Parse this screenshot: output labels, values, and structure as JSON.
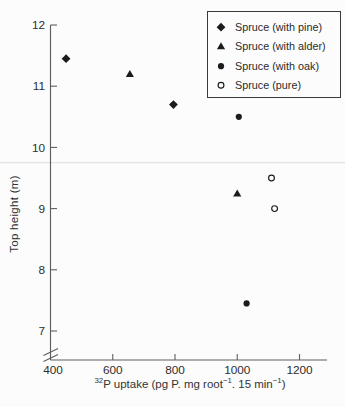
{
  "figure": {
    "background_color": "#fcfcfc",
    "ink_color": "#1c1c1c",
    "axis_color": "#5f5f5f",
    "artifact_line_color": "#dcdcdc"
  },
  "chart_data": {
    "type": "scatter",
    "title": "",
    "ylabel": "Top height (m)",
    "xlabel": "³²P uptake (pg P. mg root⁻¹. 15 min⁻¹)",
    "xlabel_segments": [
      {
        "text": "32",
        "sup": true
      },
      {
        "text": "P uptake (pg P. mg root",
        "sup": false
      },
      {
        "text": "−1",
        "sup": true
      },
      {
        "text": ". 15 min",
        "sup": false
      },
      {
        "text": "−1",
        "sup": true
      },
      {
        "text": ")",
        "sup": false
      }
    ],
    "x_ticks": [
      400,
      600,
      800,
      1000,
      1200
    ],
    "y_ticks": [
      7,
      8,
      9,
      10,
      11,
      12
    ],
    "xlim": [
      400,
      1290
    ],
    "ylim": [
      7,
      12
    ],
    "grid": false,
    "y_axis_break_below": 7,
    "legend_position": "top-right",
    "series": [
      {
        "name": "Spruce (with pine)",
        "marker": "filled-diamond",
        "points": [
          [
            450,
            11.45
          ],
          [
            795,
            10.7
          ]
        ]
      },
      {
        "name": "Spruce (with alder)",
        "marker": "filled-triangle",
        "points": [
          [
            655,
            11.2
          ],
          [
            1000,
            9.25
          ]
        ]
      },
      {
        "name": "Spruce (with oak)",
        "marker": "filled-circle",
        "points": [
          [
            1005,
            10.5
          ],
          [
            1030,
            7.45
          ]
        ]
      },
      {
        "name": "Spruce (pure)",
        "marker": "open-circle",
        "points": [
          [
            1110,
            9.5
          ],
          [
            1120,
            9.0
          ]
        ]
      }
    ],
    "artifact_line_y_value": 9.75
  }
}
